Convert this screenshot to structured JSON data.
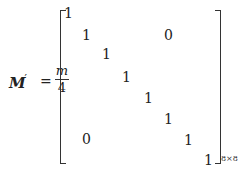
{
  "equation": {
    "lhs_symbol": "M",
    "lhs_prime": "′",
    "equals": "=",
    "fraction": {
      "numerator": "m",
      "denominator": "4"
    },
    "matrix": {
      "size_subscript": "8×8",
      "diagonal": [
        "1",
        "1",
        "1",
        "1",
        "1",
        "1",
        "1",
        "1"
      ],
      "upper_zero": "0",
      "lower_zero": "0"
    }
  }
}
